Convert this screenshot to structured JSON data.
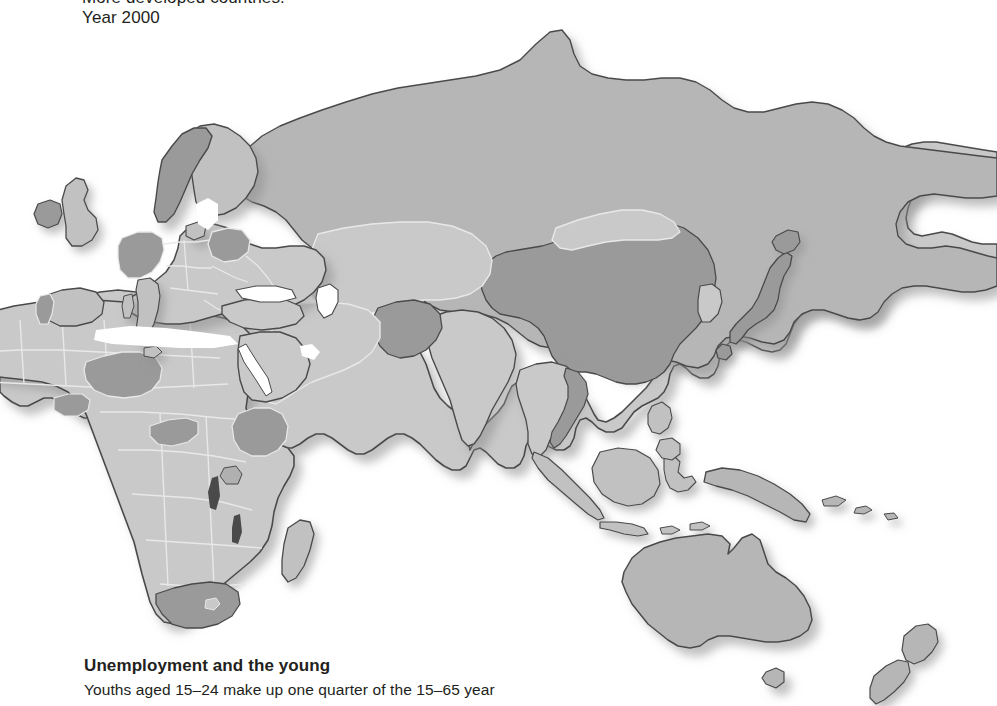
{
  "page": {
    "background_color": "#ffffff",
    "text_color": "#231f20"
  },
  "caption_top": {
    "line1": "More developed countries:",
    "line2": "Year 2000"
  },
  "caption_bottom": {
    "headline": "Unemployment and the young",
    "line1": "Youths aged 15–24 make up one quarter of the 15–65 year"
  },
  "map": {
    "projection_note": "Eastern hemisphere world map: Europe, Africa, Asia, Oceania",
    "legend_classes": [
      {
        "name": "highlighted",
        "color": "#9a9a9a",
        "label": "More developed countries"
      },
      {
        "name": "mid",
        "color": "#b6b6b6",
        "label": "Other landmass"
      },
      {
        "name": "light",
        "color": "#c9c9c9",
        "label": "Remaining countries"
      }
    ],
    "border_color": "#4a4a4a",
    "internal_border_color": "#e8e8e8",
    "shadow_color": "rgba(120,120,120,0.45)",
    "highlighted_regions": [
      "Norway",
      "Ireland",
      "Portugal",
      "Germany",
      "Belarus",
      "China",
      "Japan",
      "Mongolia-border",
      "Kazakhstan-east",
      "Afghanistan",
      "Pakistan",
      "Vietnam",
      "Myanmar-east",
      "Niger",
      "Burkina Faso",
      "Central African Republic",
      "Ethiopia",
      "South Africa"
    ],
    "mid_regions": [
      "Russia",
      "Australia",
      "New Zealand",
      "Papua New Guinea",
      "Indonesia-east"
    ],
    "light_regions": [
      "India",
      "Central Asia",
      "Middle East",
      "most of Africa",
      "Western Europe",
      "Southeast Asia islands"
    ]
  }
}
